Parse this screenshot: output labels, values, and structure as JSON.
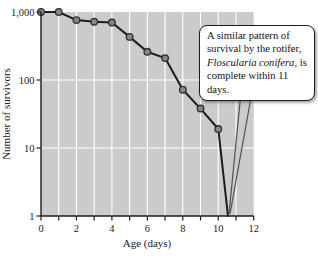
{
  "chart_data": {
    "type": "line",
    "yscale": "log",
    "title": "",
    "xlabel": "Age (days)",
    "ylabel": "Number of survivors",
    "xlim": [
      0,
      12
    ],
    "ylim": [
      1,
      1000
    ],
    "x": [
      0,
      1,
      2,
      3,
      4,
      5,
      6,
      7,
      8,
      9,
      10,
      10.55
    ],
    "values": [
      1000,
      1000,
      760,
      720,
      700,
      430,
      260,
      210,
      72,
      38,
      19,
      1
    ],
    "markers": [
      true,
      true,
      true,
      true,
      true,
      true,
      true,
      true,
      true,
      true,
      true,
      false
    ],
    "x_ticks": [
      {
        "value": 0,
        "label": "0"
      },
      {
        "value": 2,
        "label": "2"
      },
      {
        "value": 4,
        "label": "4"
      },
      {
        "value": 6,
        "label": "6"
      },
      {
        "value": 8,
        "label": "8"
      },
      {
        "value": 10,
        "label": "10"
      },
      {
        "value": 12,
        "label": "12"
      }
    ],
    "x_minor_ticks": [
      0,
      1,
      2,
      3,
      4,
      5,
      6,
      7,
      8,
      9,
      10,
      11,
      12
    ],
    "y_ticks": [
      {
        "value": 1000,
        "label": "1,000"
      },
      {
        "value": 100,
        "label": "100"
      },
      {
        "value": 10,
        "label": "10"
      },
      {
        "value": 1,
        "label": "1"
      }
    ],
    "grid_days": [
      1,
      2,
      3,
      4,
      5,
      6,
      7,
      8,
      9,
      10,
      11
    ],
    "grid_values": [
      100,
      10
    ],
    "grid": true,
    "legend": "none",
    "annotation": "A similar pattern of survival by the rotifer, Floscularia conifera, is complete within 11 days."
  },
  "callout": {
    "text_before": "A similar pattern of survival by the rotifer, ",
    "species": "Floscularia conifera",
    "text_after": ", is complete within 11 days."
  },
  "colors": {
    "plot_bg": "#cbcbcb",
    "gridline": "#ffffff",
    "line": "#1c1c1c",
    "marker_fill": "#878787",
    "marker_stroke": "#2e2e2e",
    "axis": "#1c1c1c",
    "tick": "#1c1c1c",
    "callout_bg": "#ffffff",
    "callout_border": "#1c1c1c",
    "wedge_stroke": "#4f4f4f",
    "wedge_fill": "#cbcbcb"
  }
}
